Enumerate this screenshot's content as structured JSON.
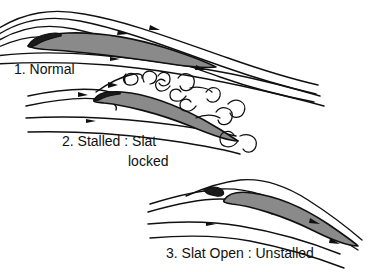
{
  "figure": {
    "background_color": "#ffffff",
    "line_color": "#101010",
    "airfoil_fill_color": "#8a8a8a",
    "nose_fill_color": "#1a1a1a"
  },
  "panels": [
    {
      "id": "panel-normal",
      "number": "1.",
      "caption_line1": "1. Normal",
      "caption_line2": "",
      "flow_state": "attached",
      "angle_of_attack_deg": 8,
      "slat": "retracted",
      "streamline_count": 5,
      "vortex_count": 0
    },
    {
      "id": "panel-stalled",
      "number": "2.",
      "caption_line1": "2. Stalled : Slat",
      "caption_line2": "locked",
      "flow_state": "separated",
      "angle_of_attack_deg": 22,
      "slat": "locked",
      "streamline_count": 4,
      "vortex_count": 8
    },
    {
      "id": "panel-slat-open",
      "number": "3.",
      "caption_line1": "3. Slat Open : Unstalled",
      "caption_line2": "",
      "flow_state": "attached",
      "angle_of_attack_deg": 22,
      "slat": "open",
      "streamline_count": 4,
      "vortex_count": 0
    }
  ]
}
